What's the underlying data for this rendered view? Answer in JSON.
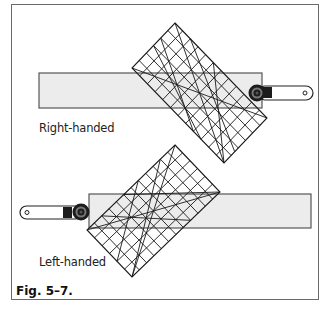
{
  "figure": {
    "caption": "Fig. 5–7.",
    "panels": [
      {
        "id": "right-handed",
        "label": "Right-handed",
        "cutter_side": "right"
      },
      {
        "id": "left-handed",
        "label": "Left-handed",
        "cutter_side": "left"
      }
    ]
  },
  "colors": {
    "frame": "#6a6a6a",
    "fabric_strip": "#ececec",
    "grid_lines": "#1a1a1a",
    "cutter": "#1c1c1c"
  }
}
